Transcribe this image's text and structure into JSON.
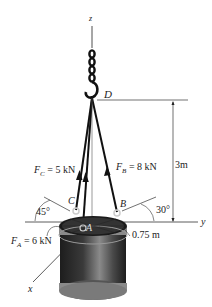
{
  "axes": {
    "z": "z",
    "y": "y",
    "x": "x"
  },
  "points": {
    "A": "A",
    "B": "B",
    "C": "C",
    "D": "D"
  },
  "forces": {
    "FA": {
      "symbol": "F",
      "sub": "A",
      "value": "= 6 kN"
    },
    "FB": {
      "symbol": "F",
      "sub": "B",
      "value": "= 8 kN"
    },
    "FC": {
      "symbol": "F",
      "sub": "C",
      "value": "= 5 kN"
    }
  },
  "dimensions": {
    "height": "3m",
    "radius": "0.75 m"
  },
  "angles": {
    "left": "45°",
    "right": "30°"
  },
  "colors": {
    "ink": "#222222",
    "drum_dark": "#2a2a2a",
    "drum_mid": "#6b6b6b",
    "drum_rim": "#8a8a8a"
  }
}
